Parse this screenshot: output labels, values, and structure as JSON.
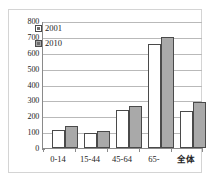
{
  "chart_data": {
    "type": "bar",
    "title": "",
    "xlabel": "",
    "ylabel": "",
    "ylim": [
      0,
      800
    ],
    "ytick_step": 100,
    "yticks": [
      "800",
      "700",
      "600",
      "500",
      "400",
      "300",
      "200",
      "100",
      "0"
    ],
    "grid": true,
    "legend_position": "upper-left-inside",
    "categories": [
      "0-14",
      "15-44",
      "45-64",
      "65-",
      "全体"
    ],
    "series": [
      {
        "name": "2001",
        "values": [
          112,
          96,
          240,
          660,
          235
        ],
        "color": "#ffffff"
      },
      {
        "name": "2010",
        "values": [
          142,
          106,
          266,
          702,
          291
        ],
        "color": "#a9a9a9"
      }
    ]
  },
  "legend": {
    "items": [
      {
        "label": "2001",
        "swatch": "legend-swatch-white"
      },
      {
        "label": "2010",
        "swatch": "legend-swatch-gray"
      }
    ]
  },
  "axis": {
    "y_labels": [
      "800",
      "700",
      "600",
      "500",
      "400",
      "300",
      "200",
      "100",
      "0"
    ],
    "x_labels": [
      "0-14",
      "15-44",
      "45-64",
      "65-",
      "全体"
    ]
  },
  "colors": {
    "series_2001": "#ffffff",
    "series_2010": "#a9a9a9",
    "bar_border": "#4a4a4a",
    "gridline": "#b9b9b9",
    "axis_line": "#8a8a8a",
    "frame_border": "#d4d4d4",
    "text": "#232323",
    "background": "#ffffff"
  }
}
